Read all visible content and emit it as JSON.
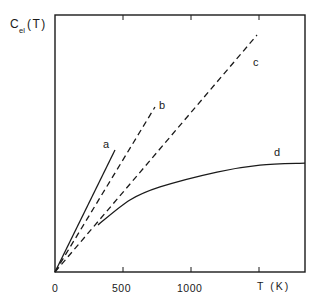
{
  "chart_data": {
    "type": "line",
    "title": "",
    "ylabel": "C",
    "ylabel_sub": "el",
    "ylabel_suffix": "(T)",
    "xlabel": "T (K)",
    "xlim": [
      0,
      1838
    ],
    "ylim": [
      0,
      100
    ],
    "x_ticks": [
      0,
      500,
      1000,
      1500
    ],
    "x_tick_labels": [
      "0",
      "500",
      "1000",
      ""
    ],
    "y_ticks": [],
    "grid": false,
    "legend": "none (curves labelled inline a, b, c, d)",
    "series": [
      {
        "name": "a",
        "style": "solid",
        "x": [
          0,
          441
        ],
        "y": [
          0,
          47.5
        ]
      },
      {
        "name": "b",
        "style": "dashed",
        "x": [
          0,
          735
        ],
        "y": [
          0,
          64.2
        ]
      },
      {
        "name": "c",
        "style": "dashed",
        "x": [
          0,
          1485
        ],
        "y": [
          0,
          92.2
        ]
      },
      {
        "name": "d",
        "style": "solid",
        "x": [
          316,
          551,
          772,
          1191,
          1507,
          1838
        ],
        "y": [
          18.3,
          28.0,
          33.1,
          38.9,
          41.6,
          42.4
        ]
      }
    ],
    "annotations": [
      {
        "text": "a",
        "x": 441,
        "y": 50
      },
      {
        "text": "b",
        "x": 790,
        "y": 65
      },
      {
        "text": "c",
        "x": 1520,
        "y": 81
      },
      {
        "text": "d",
        "x": 1625,
        "y": 46
      }
    ]
  },
  "labels": {
    "y_axis_main": "C",
    "y_axis_sub": "el",
    "y_axis_suffix": "(T)",
    "x_axis": "T (K)",
    "tick_0": "0",
    "tick_500": "500",
    "tick_1000": "1000",
    "curve_a": "a",
    "curve_b": "b",
    "curve_c": "c",
    "curve_d": "d"
  }
}
